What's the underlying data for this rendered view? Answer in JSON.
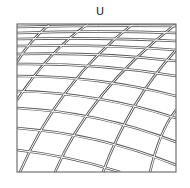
{
  "diagram": {
    "title": "U",
    "frame": {
      "x": 17,
      "y": 24,
      "width": 159,
      "height": 148,
      "stroke": "#555555"
    },
    "line_color": "#5a5a5a",
    "horizontal_lines": [
      "M17,27 Q100,25 176,26",
      "M17,33 Q100,30 176,33",
      "M17,39 Q100,37 176,41",
      "M17,46 Q100,44 176,50",
      "M17,54 Q100,52 176,61",
      "M17,64 Q100,63 176,76",
      "M17,76 Q100,76 176,96",
      "M17,91 Q100,93 176,118",
      "M17,108 Q100,112 176,142",
      "M17,128 Q100,134 176,165",
      "M17,150 Q70,156 120,172"
    ],
    "diagonal_lines": [
      "M17,62 Q30,40 50,24",
      "M17,100 Q50,50 88,24",
      "M20,172 Q60,80 133,24",
      "M55,172 Q90,90 176,24",
      "M103,172 Q130,100 176,50",
      "M150,172 Q160,130 176,110"
    ]
  }
}
